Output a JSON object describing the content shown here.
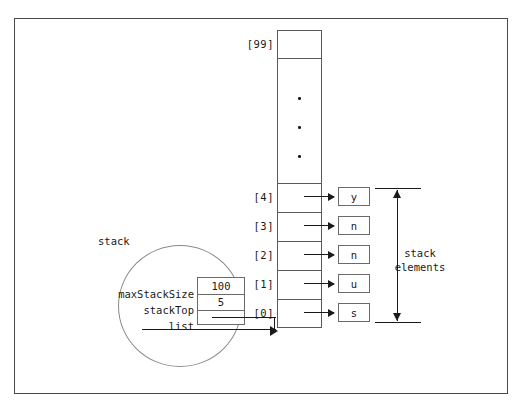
{
  "diagram": {
    "object_label": "stack",
    "bracket_label_line1": "stack",
    "bracket_label_line2": "elements",
    "struct_fields": [
      {
        "name": "maxStackSize",
        "value": "100"
      },
      {
        "name": "stackTop",
        "value": "5"
      },
      {
        "name": "list",
        "value": ""
      }
    ],
    "array": {
      "top_index": "[99]",
      "gap_dots": 3,
      "indices": [
        "[4]",
        "[3]",
        "[2]",
        "[1]",
        "[0]"
      ],
      "values": [
        "y",
        "n",
        "n",
        "u",
        "s"
      ]
    },
    "colors": {
      "frame": "#4a4a4a",
      "cell_stroke": "#5a5a5a",
      "box_stroke": "#6a6a6a",
      "ellipse_stroke": "#8a8a8a",
      "arrow": "#1a1a1a",
      "text": "#1a1a1a",
      "background": "#ffffff"
    }
  }
}
